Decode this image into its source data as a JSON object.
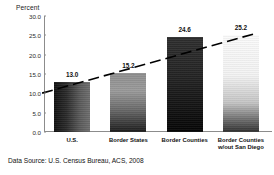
{
  "chart_data": {
    "type": "bar",
    "title": "",
    "subtitle": "",
    "xlabel": "",
    "ylabel": "Percent",
    "categories": [
      "U.S.",
      "Border States",
      "Border Counties",
      "Border Counties w/out San Diego"
    ],
    "category_lines": [
      [
        "U.S."
      ],
      [
        "Border States"
      ],
      [
        "Border Counties"
      ],
      [
        "Border Counties",
        "w/out San Diego"
      ]
    ],
    "values": [
      13.0,
      15.2,
      24.6,
      25.2
    ],
    "value_labels": [
      "13.0",
      "15.2",
      "24.6",
      "25.2"
    ],
    "ylim": [
      0.0,
      30.0
    ],
    "ytick_values": [
      0.0,
      5.0,
      10.0,
      15.0,
      20.0,
      25.0,
      30.0
    ],
    "ytick_labels": [
      "0.0",
      "5.0",
      "10.0",
      "15.0",
      "20.0",
      "25.0",
      "30.0"
    ],
    "grid": false,
    "legend": false,
    "legend_position": "none",
    "annotations": [
      {
        "name": "trend-line",
        "style": "dashed",
        "color": "#000000",
        "description": "Rising dashed trend line from left to right across the bars"
      }
    ],
    "bar_styles": [
      {
        "name": "bar-us",
        "fill": "horizontal-gradient-dark-to-gray"
      },
      {
        "name": "bar-border-states",
        "fill": "vertical-gradient-gray-to-dark"
      },
      {
        "name": "bar-border-counties",
        "fill": "vertical-gradient-dark-to-black"
      },
      {
        "name": "bar-border-counties-wo-san-diego",
        "fill": "vertical-gradient-white-to-dark"
      }
    ]
  },
  "footer": {
    "source_note": "Data Source:  U.S. Census Bureau, ACS, 2008"
  },
  "colors": {
    "axis": "#8c8c8c",
    "text": "#111111",
    "background": "#ffffff",
    "trend_line": "#000000"
  }
}
